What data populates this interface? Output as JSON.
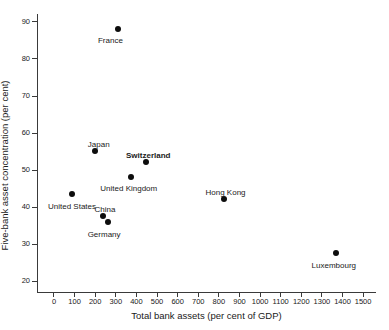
{
  "chart_data": {
    "type": "scatter",
    "title": "",
    "xlabel": "Total bank assets (per cent of GDP)",
    "ylabel": "Five-bank asset concentration (per cent)",
    "xlim": [
      -80,
      1560
    ],
    "ylim": [
      17,
      92
    ],
    "xticks": [
      0,
      100,
      200,
      300,
      400,
      500,
      600,
      700,
      800,
      900,
      1000,
      1100,
      1200,
      1300,
      1400,
      1500
    ],
    "yticks": [
      20,
      30,
      40,
      50,
      60,
      70,
      80,
      90
    ],
    "grid": false,
    "legend": "none",
    "marker_color": "#0d0d0d",
    "points": [
      {
        "label": "France",
        "x": 315,
        "y": 88,
        "label_dx": -8,
        "label_dy": 12,
        "label_anchor": "middle",
        "bold": false
      },
      {
        "label": "Japan",
        "x": 200,
        "y": 55,
        "label_dx": 4,
        "label_dy": -6,
        "label_anchor": "middle",
        "bold": false
      },
      {
        "label": "Switzerland",
        "x": 450,
        "y": 52,
        "label_dx": 2,
        "label_dy": -6,
        "label_anchor": "middle",
        "bold": true
      },
      {
        "label": "United Kingdom",
        "x": 375,
        "y": 48,
        "label_dx": -2,
        "label_dy": 12,
        "label_anchor": "middle",
        "bold": false
      },
      {
        "label": "United States",
        "x": 90,
        "y": 43.5,
        "label_dx": 0,
        "label_dy": 13,
        "label_anchor": "middle",
        "bold": false
      },
      {
        "label": "China",
        "x": 240,
        "y": 37.5,
        "label_dx": 2,
        "label_dy": -6,
        "label_anchor": "middle",
        "bold": false
      },
      {
        "label": "Germany",
        "x": 265,
        "y": 36,
        "label_dx": -4,
        "label_dy": 13,
        "label_anchor": "middle",
        "bold": false
      },
      {
        "label": "Hong Kong",
        "x": 825,
        "y": 42,
        "label_dx": 2,
        "label_dy": -6,
        "label_anchor": "middle",
        "bold": false
      },
      {
        "label": "Luxembourg",
        "x": 1370,
        "y": 27.5,
        "label_dx": -2,
        "label_dy": 13,
        "label_anchor": "middle",
        "bold": false
      }
    ]
  }
}
